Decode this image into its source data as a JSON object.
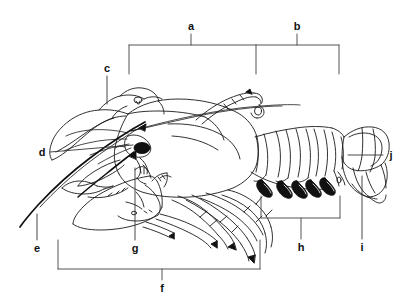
{
  "figure": {
    "background_color": "#ffffff",
    "line_color": "#1a1a1a",
    "label_color": "#111111",
    "width": 411,
    "height": 302
  },
  "labels": {
    "a": "a",
    "b": "b",
    "c": "c",
    "d": "d",
    "e": "e",
    "f": "f",
    "g": "g",
    "h": "h",
    "i": "i",
    "j": "j"
  },
  "label_positions": {
    "a": {
      "x": 191,
      "y": 26
    },
    "b": {
      "x": 297,
      "y": 26
    },
    "c": {
      "x": 107,
      "y": 68
    },
    "d": {
      "x": 42,
      "y": 152
    },
    "e": {
      "x": 37,
      "y": 248
    },
    "f": {
      "x": 162,
      "y": 288
    },
    "g": {
      "x": 135,
      "y": 248
    },
    "h": {
      "x": 301,
      "y": 247
    },
    "i": {
      "x": 362,
      "y": 247
    },
    "j": {
      "x": 391,
      "y": 155
    }
  },
  "brackets": [
    {
      "name": "bracket-a",
      "label": "a",
      "x_start": 129,
      "x_end": 256,
      "y": 45,
      "stem_x": 191,
      "stem_y_end": 34,
      "tick_y_end": 74
    },
    {
      "name": "bracket-b",
      "label": "b",
      "x_start": 256,
      "x_end": 339,
      "y": 45,
      "stem_x": 297,
      "stem_y_end": 34,
      "tick_y_end": 74
    },
    {
      "name": "bracket-f",
      "label": "f",
      "x_start": 58,
      "x_end": 260,
      "y": 269,
      "stem_x": 162,
      "stem_y_end": 280,
      "tick_y_end": 240
    },
    {
      "name": "bracket-h",
      "label": "h",
      "x_start": 261,
      "x_end": 340,
      "y": 218,
      "stem_x": 301,
      "stem_y_end": 239,
      "tick_y_end": 196
    }
  ],
  "leaders": [
    {
      "name": "leader-c",
      "label": "c",
      "x1": 107,
      "y1": 76,
      "x2": 107,
      "y2": 104
    },
    {
      "name": "leader-d",
      "label": "d",
      "x1": 50,
      "y1": 152,
      "x2": 133,
      "y2": 145
    },
    {
      "name": "leader-e",
      "label": "e",
      "x1": 37,
      "y1": 240,
      "x2": 37,
      "y2": 215
    },
    {
      "name": "leader-g",
      "label": "g",
      "x1": 135,
      "y1": 240,
      "x2": 135,
      "y2": 168
    },
    {
      "name": "leader-i",
      "label": "i",
      "x1": 362,
      "y1": 239,
      "x2": 362,
      "y2": 176
    },
    {
      "name": "leader-j",
      "label": "j",
      "x1": 383,
      "y1": 155,
      "x2": 348,
      "y2": 155
    }
  ]
}
